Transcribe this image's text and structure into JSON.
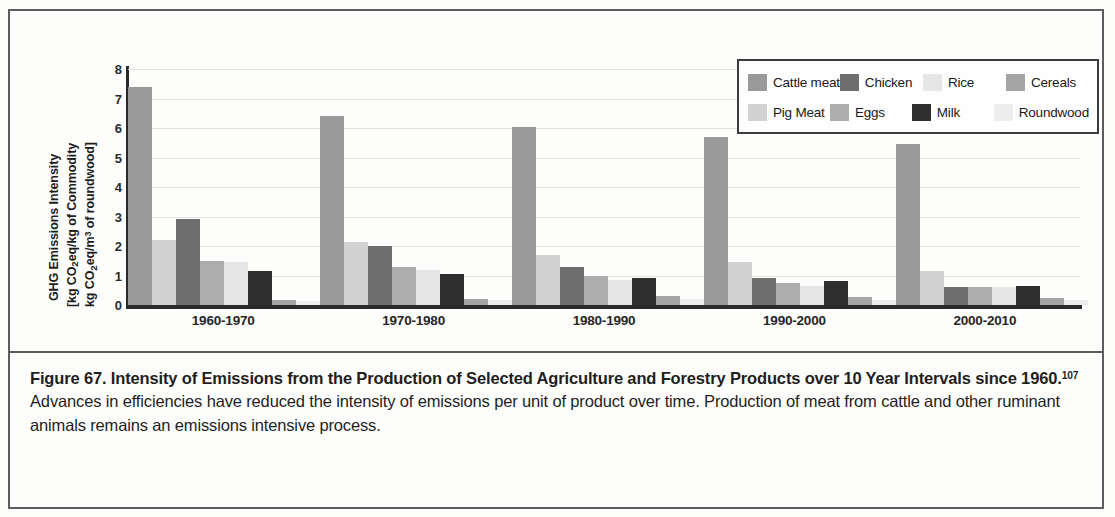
{
  "figure": {
    "caption_bold": "Figure 67. Intensity of Emissions from the Production of Selected Agriculture and Forestry Products over 10 Year Intervals since 1960.",
    "caption_footnote": "107",
    "caption_rest": " Advances in efficiencies have reduced the intensity of emissions per unit of product over time. Production of meat from cattle and other ruminant animals remains an emissions intensive process."
  },
  "y_axis_title": {
    "line1": "GHG Emissions Intensity",
    "line2_pre": "[kg CO",
    "line2_sub": "2",
    "line2_post": "eq/kg of Commodity",
    "line3_pre": "kg CO",
    "line3_sub": "2",
    "line3_mid": "eq/m",
    "line3_sup": "3",
    "line3_post": " of roundwood]"
  },
  "chart_data": {
    "type": "bar",
    "title": "",
    "xlabel": "",
    "ylabel": "GHG Emissions Intensity [kg CO2eq/kg of Commodity kg CO2eq/m3 of roundwood]",
    "ylim": [
      0,
      8
    ],
    "yticks": [
      0,
      1,
      2,
      3,
      4,
      5,
      6,
      7,
      8
    ],
    "ytick_labels": [
      "0",
      "1",
      "2",
      "3",
      "4",
      "5",
      "6",
      "7",
      "8"
    ],
    "grid": true,
    "legend_position": "top-right",
    "categories": [
      "1960-1970",
      "1970-1980",
      "1980-1990",
      "1990-2000",
      "2000-2010"
    ],
    "series": [
      {
        "name": "Cattle meat",
        "color": "#9a9a9a",
        "values": [
          7.4,
          6.4,
          6.05,
          5.7,
          5.45
        ]
      },
      {
        "name": "Pig Meat",
        "color": "#d2d2d2",
        "values": [
          2.2,
          2.15,
          1.7,
          1.45,
          1.15
        ]
      },
      {
        "name": "Chicken",
        "color": "#6e6e6e",
        "values": [
          2.9,
          2.0,
          1.3,
          0.9,
          0.6
        ]
      },
      {
        "name": "Eggs",
        "color": "#adadad",
        "values": [
          1.5,
          1.3,
          1.0,
          0.75,
          0.6
        ]
      },
      {
        "name": "Rice",
        "color": "#e6e6e6",
        "values": [
          1.45,
          1.2,
          0.85,
          0.65,
          0.6
        ]
      },
      {
        "name": "Milk",
        "color": "#2f2f2f",
        "values": [
          1.15,
          1.05,
          0.9,
          0.8,
          0.65
        ]
      },
      {
        "name": "Cereals",
        "color": "#a5a5a5",
        "values": [
          0.18,
          0.2,
          0.3,
          0.28,
          0.25
        ]
      },
      {
        "name": "Roundwood",
        "color": "#ededed",
        "values": [
          0.14,
          0.16,
          0.2,
          0.18,
          0.16
        ]
      }
    ]
  }
}
